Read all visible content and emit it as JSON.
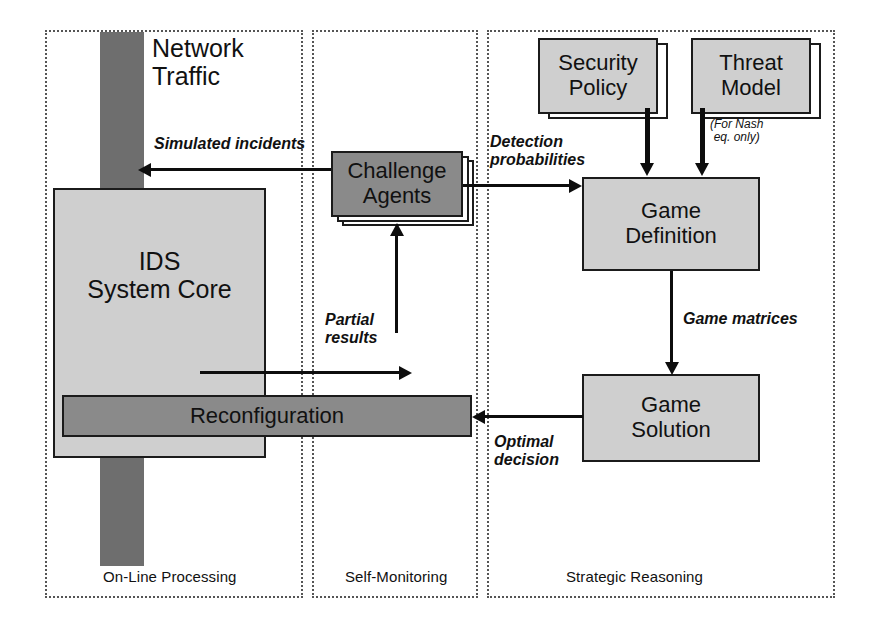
{
  "diagram": {
    "zones": [
      {
        "id": "on-line-processing",
        "label": "On-Line Processing"
      },
      {
        "id": "self-monitoring",
        "label": "Self-Monitoring"
      },
      {
        "id": "strategic-reasoning",
        "label": "Strategic Reasoning"
      }
    ],
    "nodes": {
      "network_traffic": "Network\nTraffic",
      "ids_system_core": "IDS\nSystem Core",
      "reconfiguration": "Reconfiguration",
      "challenge_agents": "Challenge\nAgents",
      "security_policy": "Security\nPolicy",
      "threat_model": "Threat\nModel",
      "game_definition": "Game\nDefinition",
      "game_solution": "Game\nSolution"
    },
    "edge_labels": {
      "simulated_incidents": "Simulated incidents",
      "detection_probabilities": "Detection\nprobabilities",
      "partial_results": "Partial\nresults",
      "game_matrices": "Game matrices",
      "optimal_decision": "Optimal\ndecision"
    },
    "notes": {
      "for_nash_only": "(For Nash\neq. only)"
    },
    "colors": {
      "fill_light": "#cfcfcf",
      "fill_dark": "#8a8a8a",
      "slab": "#6e6e6e",
      "stroke": "#1b1b1b",
      "connector": "#0d0d0d",
      "zone_border": "#555555"
    }
  }
}
